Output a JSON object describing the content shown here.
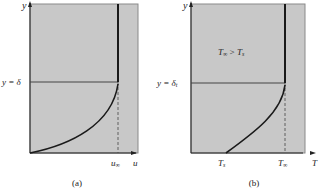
{
  "panels": [
    {
      "id": "a",
      "caption": "(a)",
      "y_axis_label": "y",
      "x_axis_label": "u",
      "boundary_label": "y = δ",
      "free_stream_label": "u∞",
      "free_stream_main": "u",
      "free_stream_sub": "∞"
    },
    {
      "id": "b",
      "caption": "(b)",
      "y_axis_label": "y",
      "x_axis_label": "T",
      "boundary_label_main": "y = δ",
      "boundary_label_sub": "t",
      "surface_label_main": "T",
      "surface_label_sub": "s",
      "free_stream_main": "T",
      "free_stream_sub": "∞",
      "condition_main1": "T",
      "condition_sub1": "∞",
      "condition_op": " > ",
      "condition_main2": "T",
      "condition_sub2": "s"
    }
  ],
  "colors": {
    "background": "#ffffff",
    "panel_fill": "#c8c8c8",
    "panel_border": "#8a8a8a",
    "curve": "#1a1a1a"
  }
}
